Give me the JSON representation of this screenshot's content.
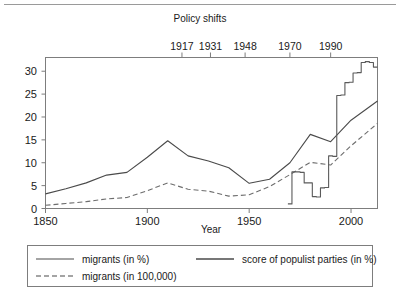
{
  "chart_data": {
    "type": "line",
    "title": "",
    "xlabel": "Year",
    "ylabel": "",
    "xlim": [
      1850,
      2013
    ],
    "ylim": [
      0,
      33
    ],
    "grid": false,
    "legend_position": "bottom",
    "xticks": [
      1850,
      1900,
      1950,
      2000
    ],
    "xtick_labels": [
      "1850",
      "1900",
      "1950",
      "2000"
    ],
    "yticks": [
      0,
      5,
      10,
      15,
      20,
      25,
      30
    ],
    "ytick_labels": [
      "0",
      "5",
      "10",
      "15",
      "20",
      "25",
      "30"
    ],
    "secondary_axis": {
      "position": "top",
      "title": "Policy shifts",
      "ticks": [
        1917,
        1931,
        1948,
        1970,
        1990
      ],
      "tick_labels": [
        "1917",
        "1931",
        "1948",
        "1970",
        "1990"
      ]
    },
    "series": [
      {
        "name": "migrants (in %)",
        "style": "solid",
        "color": "#4a4a4a",
        "x": [
          1850,
          1860,
          1870,
          1880,
          1890,
          1900,
          1910,
          1920,
          1930,
          1940,
          1950,
          1960,
          1970,
          1980,
          1990,
          2000,
          2013
        ],
        "values": [
          3.2,
          4.3,
          5.6,
          7.3,
          7.9,
          11.2,
          14.8,
          11.5,
          10.4,
          8.9,
          5.5,
          6.4,
          10.0,
          16.2,
          14.6,
          19.3,
          23.5
        ]
      },
      {
        "name": "migrants (in 100,000)",
        "style": "dashed",
        "color": "#6d6d6d",
        "x": [
          1850,
          1860,
          1870,
          1880,
          1890,
          1900,
          1910,
          1920,
          1930,
          1940,
          1950,
          1960,
          1970,
          1980,
          1990,
          2000,
          2013
        ],
        "values": [
          0.7,
          1.1,
          1.5,
          2.1,
          2.4,
          3.9,
          5.6,
          4.2,
          3.8,
          2.7,
          3.0,
          4.8,
          7.4,
          10.1,
          9.5,
          13.7,
          18.6
        ]
      },
      {
        "name": "score of populist parties (in %)",
        "style": "step",
        "color": "#5a5a5a",
        "x": [
          1969,
          1971,
          1975,
          1977,
          1979,
          1981,
          1983,
          1985,
          1987,
          1989,
          1991,
          1993,
          1995,
          1997,
          1999,
          2001,
          2003,
          2005,
          2007,
          2009,
          2011,
          2013
        ],
        "values": [
          1.0,
          8.0,
          7.9,
          5.6,
          5.6,
          2.6,
          2.5,
          4.5,
          4.6,
          11.5,
          11.4,
          24.7,
          24.8,
          27.5,
          27.6,
          29.6,
          29.7,
          31.9,
          32.1,
          31.9,
          30.9,
          30.9
        ]
      }
    ]
  },
  "legend": {
    "entries": [
      {
        "label": "migrants (in %)",
        "style": "solid"
      },
      {
        "label": "score of populist parties (in %)",
        "style": "solid-thick"
      },
      {
        "label": "migrants (in 100,000)",
        "style": "dashed"
      }
    ]
  }
}
